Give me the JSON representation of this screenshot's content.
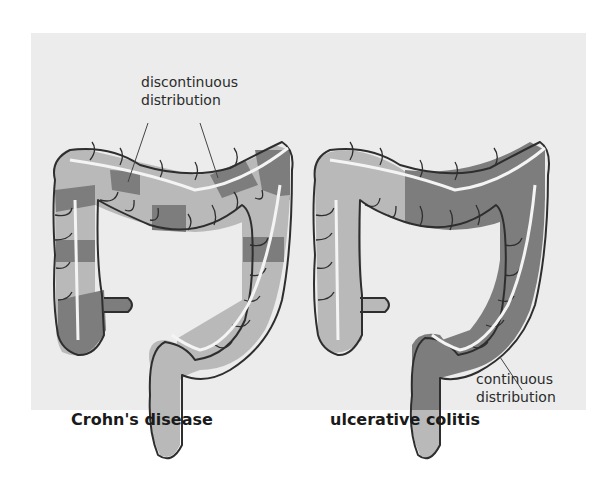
{
  "diagram": {
    "panels": [
      {
        "id": "crohns",
        "title": "Crohn's disease",
        "annotation": {
          "line1": "discontinuous",
          "line2": "distribution"
        }
      },
      {
        "id": "uc",
        "title": "ulcerative colitis",
        "annotation": {
          "line1": "continuous",
          "line2": "distribution"
        }
      }
    ],
    "colors": {
      "background": "#ececec",
      "healthy": "#b9b9b9",
      "inflamed": "#7d7d7d",
      "outline": "#2e2e2e",
      "lumen_line": "#f4f4f4"
    }
  }
}
